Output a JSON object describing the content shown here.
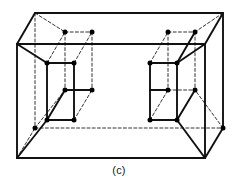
{
  "figure": {
    "caption": "(c)",
    "label": "crystal-unit-cell-diagram",
    "colors": {
      "solid_line": "#111111",
      "dashed_line": "#333333",
      "atom_fill": "#000000",
      "background": "#ffffff"
    },
    "style": {
      "solid_stroke_width": 1.9,
      "dashed_stroke_width": 1.0,
      "dash_pattern": "3,2.2",
      "atom_radius": 2.5
    }
  },
  "geometry": {
    "outer_cell": {
      "name": "outer-orthorhombic-cell",
      "front_face": {
        "top_left": [
          17,
          44
        ],
        "top_right": [
          205,
          44
        ],
        "bottom_right": [
          205,
          158
        ],
        "bottom_left": [
          17,
          158
        ]
      },
      "back_face": {
        "top_left": [
          35,
          13
        ],
        "top_right": [
          223,
          13
        ],
        "bottom_right": [
          223,
          128
        ],
        "bottom_left": [
          35,
          128
        ]
      },
      "solid_edges": [
        [
          17,
          44,
          205,
          44
        ],
        [
          17,
          44,
          17,
          158
        ],
        [
          17,
          158,
          205,
          158
        ],
        [
          205,
          44,
          205,
          158
        ],
        [
          35,
          13,
          223,
          13
        ],
        [
          223,
          13,
          223,
          128
        ],
        [
          17,
          44,
          35,
          13
        ],
        [
          205,
          44,
          223,
          13
        ],
        [
          205,
          158,
          223,
          128
        ]
      ],
      "dashed_edges": [
        [
          35,
          13,
          35,
          128
        ],
        [
          35,
          128,
          223,
          128
        ],
        [
          17,
          158,
          35,
          128
        ]
      ]
    },
    "left_subcell": {
      "name": "left-inner-subcell",
      "front_face": {
        "top_left": [
          47,
          63
        ],
        "top_right": [
          74,
          63
        ],
        "bottom_right": [
          74,
          120
        ],
        "bottom_left": [
          47,
          120
        ]
      },
      "back_face": {
        "top_left": [
          65,
          32
        ],
        "top_right": [
          92,
          32
        ],
        "bottom_right": [
          92,
          90
        ],
        "bottom_left": [
          65,
          90
        ]
      }
    },
    "right_subcell": {
      "name": "right-inner-subcell",
      "front_face": {
        "top_left": [
          150,
          63
        ],
        "top_right": [
          177,
          63
        ],
        "bottom_right": [
          177,
          120
        ],
        "bottom_left": [
          150,
          120
        ]
      },
      "back_face": {
        "top_left": [
          168,
          32
        ],
        "top_right": [
          195,
          32
        ],
        "bottom_right": [
          195,
          90
        ],
        "bottom_left": [
          168,
          90
        ]
      }
    },
    "atoms": [
      {
        "id": "L-front-top-left",
        "x": 47,
        "y": 63
      },
      {
        "id": "L-front-top-right",
        "x": 74,
        "y": 63
      },
      {
        "id": "L-front-bottom-left",
        "x": 47,
        "y": 120
      },
      {
        "id": "L-front-bottom-right",
        "x": 74,
        "y": 120
      },
      {
        "id": "L-back-top-left",
        "x": 65,
        "y": 32
      },
      {
        "id": "L-back-top-right",
        "x": 92,
        "y": 32
      },
      {
        "id": "L-back-bottom-left",
        "x": 65,
        "y": 90
      },
      {
        "id": "L-back-bottom-right",
        "x": 92,
        "y": 90
      },
      {
        "id": "R-front-top-left",
        "x": 150,
        "y": 63
      },
      {
        "id": "R-front-top-right",
        "x": 177,
        "y": 63
      },
      {
        "id": "R-front-bottom-left",
        "x": 150,
        "y": 120
      },
      {
        "id": "R-front-bottom-right",
        "x": 177,
        "y": 120
      },
      {
        "id": "R-back-top-left",
        "x": 168,
        "y": 32
      },
      {
        "id": "R-back-top-right",
        "x": 195,
        "y": 32
      },
      {
        "id": "R-back-bottom-left",
        "x": 168,
        "y": 90
      },
      {
        "id": "R-back-bottom-right",
        "x": 195,
        "y": 90
      },
      {
        "id": "outer-left-bottom-back",
        "x": 35,
        "y": 128
      },
      {
        "id": "outer-right-bottom-back",
        "x": 223,
        "y": 128
      }
    ]
  }
}
